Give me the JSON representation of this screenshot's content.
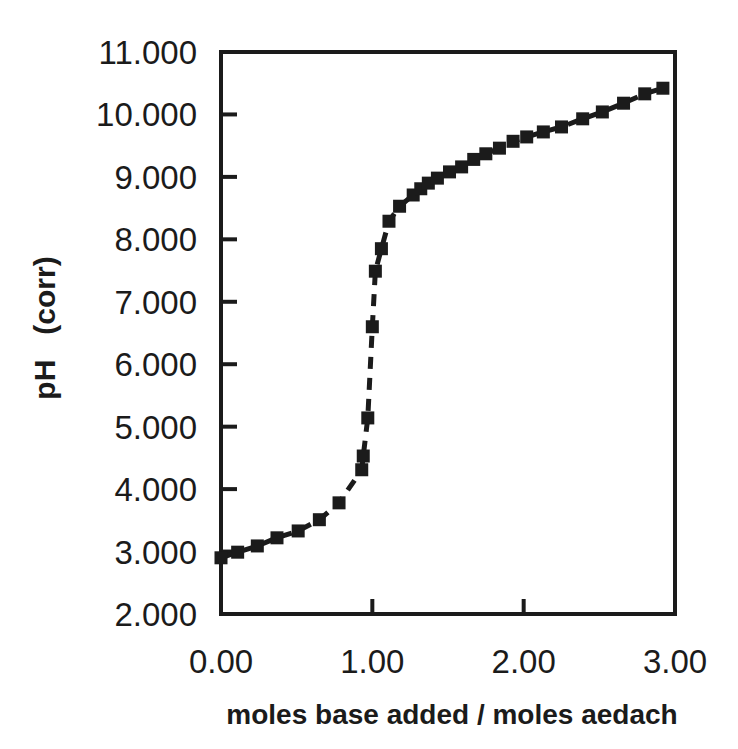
{
  "figure": {
    "background": "#ffffff",
    "ink_color": "#1b1b1b"
  },
  "chart_data": {
    "type": "scatter",
    "title": "",
    "xlabel": "moles base added / moles aedach",
    "ylabel": "pH   (corr)",
    "xlim": [
      0,
      3
    ],
    "ylim": [
      2,
      11
    ],
    "grid": false,
    "legend": "none",
    "marker": "filled-square",
    "marker_color": "#1b1b1b",
    "line_style": "dashed",
    "line_color": "#1b1b1b",
    "x_ticks": [
      {
        "value": 0,
        "label": "0.00"
      },
      {
        "value": 1,
        "label": "1.00"
      },
      {
        "value": 2,
        "label": "2.00"
      },
      {
        "value": 3,
        "label": "3.00"
      }
    ],
    "y_ticks": [
      {
        "value": 2,
        "label": "2.000"
      },
      {
        "value": 3,
        "label": "3.000"
      },
      {
        "value": 4,
        "label": "4.000"
      },
      {
        "value": 5,
        "label": "5.000"
      },
      {
        "value": 6,
        "label": "6.000"
      },
      {
        "value": 7,
        "label": "7.000"
      },
      {
        "value": 8,
        "label": "8.000"
      },
      {
        "value": 9,
        "label": "9.000"
      },
      {
        "value": 10,
        "label": "10.000"
      },
      {
        "value": 11,
        "label": "11.000"
      }
    ],
    "series": [
      {
        "name": "pH titration curve",
        "points": [
          [
            0.0,
            2.9
          ],
          [
            0.11,
            2.99
          ],
          [
            0.24,
            3.09
          ],
          [
            0.37,
            3.22
          ],
          [
            0.51,
            3.33
          ],
          [
            0.65,
            3.51
          ],
          [
            0.78,
            3.78
          ],
          [
            0.93,
            4.31
          ],
          [
            0.94,
            4.53
          ],
          [
            0.97,
            5.14
          ],
          [
            1.0,
            6.6
          ],
          [
            1.02,
            7.49
          ],
          [
            1.06,
            7.85
          ],
          [
            1.11,
            8.29
          ],
          [
            1.18,
            8.53
          ],
          [
            1.27,
            8.71
          ],
          [
            1.32,
            8.81
          ],
          [
            1.37,
            8.9
          ],
          [
            1.43,
            8.98
          ],
          [
            1.51,
            9.08
          ],
          [
            1.59,
            9.16
          ],
          [
            1.67,
            9.28
          ],
          [
            1.75,
            9.37
          ],
          [
            1.84,
            9.46
          ],
          [
            1.93,
            9.57
          ],
          [
            2.02,
            9.64
          ],
          [
            2.13,
            9.72
          ],
          [
            2.25,
            9.8
          ],
          [
            2.39,
            9.93
          ],
          [
            2.52,
            10.04
          ],
          [
            2.66,
            10.18
          ],
          [
            2.8,
            10.33
          ],
          [
            2.92,
            10.42
          ]
        ]
      }
    ]
  }
}
